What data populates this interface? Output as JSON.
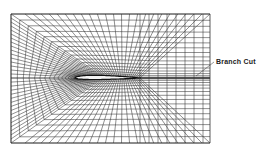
{
  "diagram": {
    "type": "C-grid mesh around airfoil",
    "annotations": [
      {
        "text": "Branch Cut",
        "x": 216,
        "y": 58
      }
    ],
    "colors": {
      "grid_line": "#333333",
      "airfoil_fill": "#f4f4f4",
      "background": "#ffffff"
    }
  }
}
